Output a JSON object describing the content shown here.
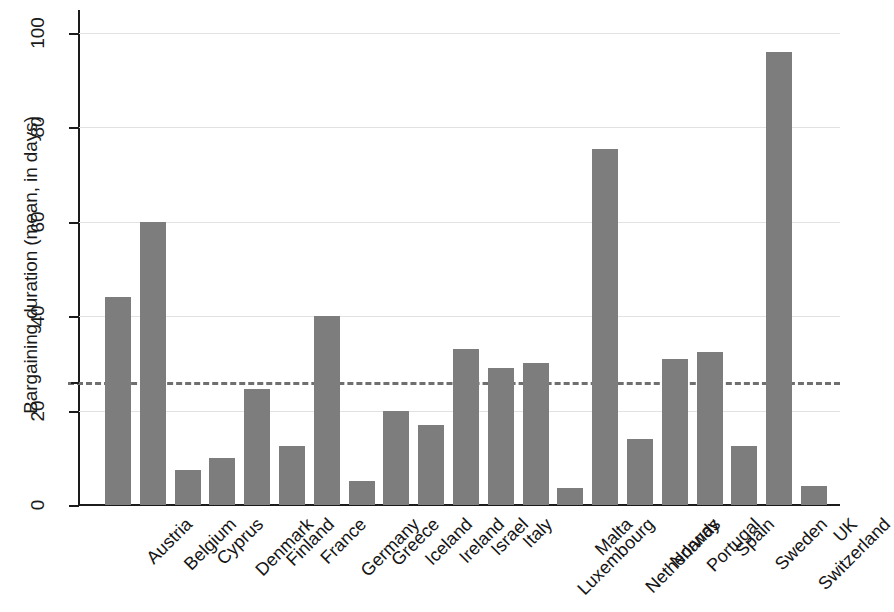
{
  "chart_data": {
    "type": "bar",
    "title": "",
    "subtitle": "",
    "xlabel": "",
    "ylabel": "Bargaining duration (mean, in days)",
    "ylim": [
      0,
      105
    ],
    "yticks": [
      0,
      20,
      40,
      60,
      80,
      100
    ],
    "ytick_labels": [
      "0",
      "20",
      "40",
      "60",
      "80",
      "100"
    ],
    "grid": "horizontal-gridlines-at-yticks",
    "legend": "none",
    "bar_color": "#7d7d7d",
    "axis_color": "#1b1b1b",
    "gridline_color": "#e2e2e2",
    "reference_line": {
      "value": 26,
      "style": "dashed",
      "color": "#6f6f6f",
      "orientation": "horizontal",
      "label": ""
    },
    "categories": [
      "Austria",
      "Belgium",
      "Cyprus",
      "Denmark",
      "Finland",
      "France",
      "Germany",
      "Greece",
      "Iceland",
      "Ireland",
      "Israel",
      "Italy",
      "Luxembourg",
      "Malta",
      "Netherlands",
      "Norway",
      "Portugal",
      "Spain",
      "Sweden",
      "Switzerland",
      "UK"
    ],
    "values": [
      44,
      60,
      7.5,
      10,
      24.5,
      12.5,
      40,
      5,
      20,
      17,
      33,
      29,
      30,
      3.5,
      75.5,
      14,
      31,
      32.5,
      12.5,
      96,
      4
    ],
    "xtick_label_rotation": -45,
    "n_bars": 21
  }
}
